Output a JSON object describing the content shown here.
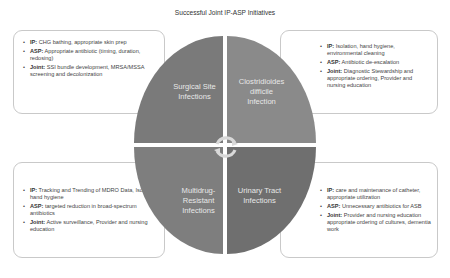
{
  "title": "Successful Joint IP-ASP Initiatives",
  "quadrants": {
    "top_left": {
      "line1": "Surgical Site",
      "line2": "Infections"
    },
    "top_right": {
      "line1": "Clostridioides",
      "line2": "difficile",
      "line3": "Infection"
    },
    "bottom_left": {
      "line1": "Multidrug-",
      "line2": "Resistant",
      "line3": "Infections"
    },
    "bottom_right": {
      "line1": "Urinary Tract",
      "line2": "Infections"
    }
  },
  "boxes": {
    "top_left": [
      {
        "label": "IP:",
        "text": " CHG bathing, appropriate skin prep"
      },
      {
        "label": "ASP:",
        "text": " Appropriate antibiotic (timing, duration, redosing)"
      },
      {
        "label": "Joint:",
        "text": " SSI bundle development, MRSA/MSSA screening and decolonization"
      }
    ],
    "top_right": [
      {
        "label": "IP:",
        "text": " Isolation, hand hygiene, environmental cleaning"
      },
      {
        "label": "ASP:",
        "text": " Antibiotic de-escalation"
      },
      {
        "label": "Joint:",
        "text": " Diagnostic Stewardship and appropriate ordering, Provider and nursing education"
      }
    ],
    "bottom_left": [
      {
        "label": "IP:",
        "text": " Tracking and Trending of MDRO Data, Isolation, hand hygiene"
      },
      {
        "label": "ASP:",
        "text": " targeted reduction in broad-spectrum antibiotics"
      },
      {
        "label": "Joint:",
        "text": " Active surveillance, Provider and nursing education"
      }
    ],
    "bottom_right": [
      {
        "label": "IP:",
        "text": " care and maintenance of catheter, appropriate utilization"
      },
      {
        "label": "ASP:",
        "text": " Unnecessary antibiotics for ASB"
      },
      {
        "label": "Joint:",
        "text": " Provider and nursing education appropriate ordering of cultures, dementia work"
      }
    ]
  },
  "colors": {
    "quadrant_tl": "#7a7a7a",
    "quadrant_tr": "#8a8a8a",
    "quadrant_bl": "#7e7e7e",
    "quadrant_br": "#6f6f6f",
    "cycle_arrows": "#d9d9d9"
  }
}
